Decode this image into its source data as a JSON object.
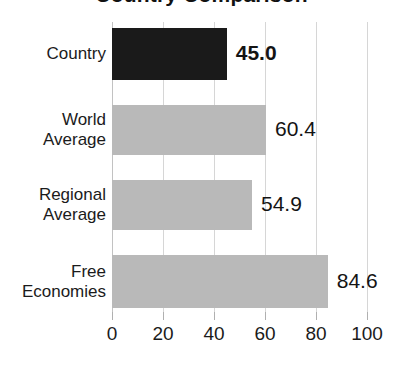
{
  "chart_data": {
    "type": "bar",
    "orientation": "horizontal",
    "title": "Country Comparison",
    "title_visible": false,
    "xlabel": "",
    "ylabel": "",
    "xlim": [
      0,
      100
    ],
    "grid": true,
    "legend": "none",
    "categories": [
      "Country",
      "World Average",
      "Regional Average",
      "Free Economies"
    ],
    "values": [
      45.0,
      60.4,
      54.9,
      84.6
    ],
    "value_labels": [
      "45.0",
      "60.4",
      "54.9",
      "84.6"
    ],
    "xticks": [
      0,
      20,
      40,
      60,
      80,
      100
    ],
    "xtick_labels": [
      "0",
      "20",
      "40",
      "60",
      "80",
      "100"
    ],
    "bar_colors": [
      "#1a1a1a",
      "#b9b9b9",
      "#b9b9b9",
      "#b9b9b9"
    ],
    "highlight_index": 0,
    "series": [
      {
        "name": "Score",
        "points": [
          {
            "category": "Country",
            "lines": [
              "Country"
            ],
            "value": 45.0,
            "label": "45.0",
            "color": "#1a1a1a",
            "emphasis": true
          },
          {
            "category": "World Average",
            "lines": [
              "World",
              "Average"
            ],
            "value": 60.4,
            "label": "60.4",
            "color": "#b9b9b9",
            "emphasis": false
          },
          {
            "category": "Regional Average",
            "lines": [
              "Regional",
              "Average"
            ],
            "value": 54.9,
            "label": "54.9",
            "color": "#b9b9b9",
            "emphasis": false
          },
          {
            "category": "Free Economies",
            "lines": [
              "Free",
              "Economies"
            ],
            "value": 84.6,
            "label": "84.6",
            "color": "#b9b9b9",
            "emphasis": false
          }
        ]
      }
    ]
  },
  "axis": {
    "ticks": [
      {
        "value": 0,
        "label": "0"
      },
      {
        "value": 20,
        "label": "20"
      },
      {
        "value": 40,
        "label": "40"
      },
      {
        "value": 60,
        "label": "60"
      },
      {
        "value": 80,
        "label": "80"
      },
      {
        "value": 100,
        "label": "100"
      }
    ]
  },
  "colors": {
    "highlight_bar": "#1a1a1a",
    "normal_bar": "#b9b9b9",
    "gridline": "#d6d6d6",
    "text": "#1b1b1b",
    "background": "#ffffff"
  }
}
